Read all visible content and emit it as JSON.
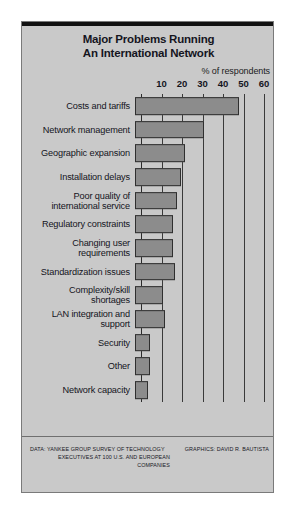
{
  "figure": {
    "title_lines": [
      "Major Problems Running",
      "An International Network"
    ],
    "axis_caption": "% of respondents",
    "footer": {
      "data_lines": [
        "DATA: YANKEE GROUP SURVEY OF TECHNOLOGY",
        "EXECUTIVES AT 100 U.S. AND EUROPEAN",
        "COMPANIES"
      ],
      "credit": "GRAPHICS: DAVID R. BAUTISTA"
    },
    "colors": {
      "panel_background": "#c9c9c9",
      "bar_fill": "#8c8c8c",
      "bar_border": "#2f2f2f",
      "gridline": "#3a3a3a",
      "text": "#15151e"
    }
  },
  "chart_data": {
    "type": "bar",
    "orientation": "horizontal",
    "title": "Major Problems Running An International Network",
    "xlabel": "% of respondents",
    "ylabel": "",
    "xlim": [
      0,
      60
    ],
    "xticks": [
      10,
      20,
      30,
      40,
      50,
      60
    ],
    "grid": true,
    "legend": false,
    "categories": [
      "Costs and tariffs",
      "Network management",
      "Geographic expansion",
      "Installation delays",
      "Poor quality of international service",
      "Regulatory constraints",
      "Changing user requirements",
      "Standardization issues",
      "Complexity/skill shortages",
      "LAN integration and support",
      "Security",
      "Other",
      "Network capacity"
    ],
    "values": [
      50,
      33,
      24,
      22,
      20,
      18,
      18,
      19,
      13,
      14,
      7,
      7,
      6
    ],
    "source": "DATA: YANKEE GROUP SURVEY OF TECHNOLOGY EXECUTIVES AT 100 U.S. AND EUROPEAN COMPANIES"
  },
  "rows": [
    {
      "label_lines": [
        "Costs and tariffs"
      ],
      "value": 50
    },
    {
      "label_lines": [
        "Network management"
      ],
      "value": 33
    },
    {
      "label_lines": [
        "Geographic expansion"
      ],
      "value": 24
    },
    {
      "label_lines": [
        "Installation delays"
      ],
      "value": 22
    },
    {
      "label_lines": [
        "Poor quality of",
        "international service"
      ],
      "value": 20
    },
    {
      "label_lines": [
        "Regulatory constraints"
      ],
      "value": 18
    },
    {
      "label_lines": [
        "Changing user",
        "requirements"
      ],
      "value": 18
    },
    {
      "label_lines": [
        "Standardization issues"
      ],
      "value": 19
    },
    {
      "label_lines": [
        "Complexity/skill",
        "shortages"
      ],
      "value": 13
    },
    {
      "label_lines": [
        "LAN integration and",
        "support"
      ],
      "value": 14
    },
    {
      "label_lines": [
        "Security"
      ],
      "value": 7
    },
    {
      "label_lines": [
        "Other"
      ],
      "value": 7
    },
    {
      "label_lines": [
        "Network capacity"
      ],
      "value": 6
    }
  ]
}
